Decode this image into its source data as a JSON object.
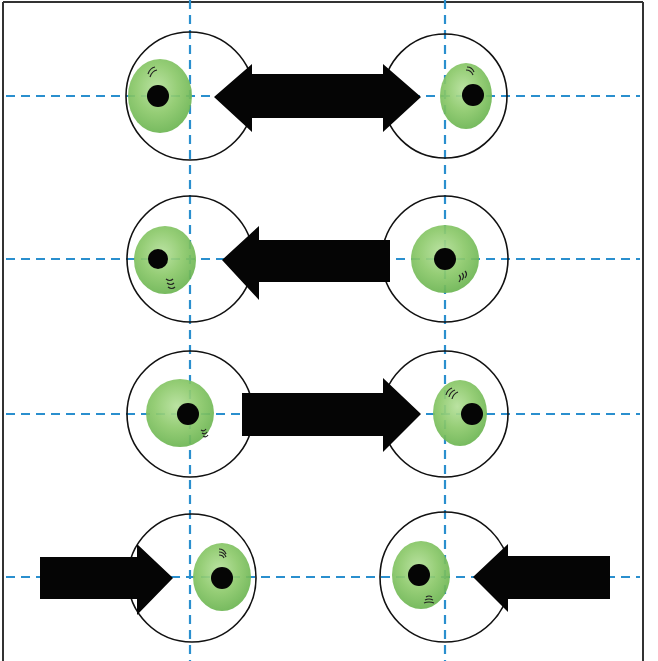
{
  "figure": {
    "colors": {
      "background": "#ffffff",
      "border": "#333333",
      "guide_line": "#2a8fce",
      "circle_outline": "#111111",
      "iris": "#8cc96a",
      "iris_dark": "#5fae47",
      "pupil": "#050505",
      "arrow": "#050505"
    },
    "frame": {
      "left": 3,
      "right": 643,
      "top": 2
    },
    "vertical_guides": [
      190,
      445
    ],
    "rows": [
      {
        "id": "row-1",
        "guide_y": 96,
        "arrow": "double-headed",
        "left_eye": {
          "circle_cx": 190,
          "iris_cx": 160,
          "pupil_cx": 158,
          "gaze": "left"
        },
        "right_eye": {
          "circle_cx": 445,
          "iris_cx": 466,
          "pupil_cx": 473,
          "gaze": "right"
        }
      },
      {
        "id": "row-2",
        "guide_y": 259,
        "arrow": "pointing-left",
        "left_eye": {
          "circle_cx": 190,
          "iris_cx": 165,
          "pupil_cx": 158,
          "gaze": "left"
        },
        "right_eye": {
          "circle_cx": 445,
          "iris_cx": 445,
          "pupil_cx": 445,
          "gaze": "center"
        }
      },
      {
        "id": "row-3",
        "guide_y": 414,
        "arrow": "pointing-right",
        "left_eye": {
          "circle_cx": 190,
          "iris_cx": 180,
          "pupil_cx": 188,
          "gaze": "center"
        },
        "right_eye": {
          "circle_cx": 445,
          "iris_cx": 460,
          "pupil_cx": 472,
          "gaze": "right"
        }
      },
      {
        "id": "row-4",
        "guide_y": 577,
        "arrow": "converging",
        "left_eye": {
          "circle_cx": 192,
          "iris_cx": 222,
          "pupil_cx": 222,
          "gaze": "right"
        },
        "right_eye": {
          "circle_cx": 445,
          "iris_cx": 421,
          "pupil_cx": 419,
          "gaze": "left"
        }
      }
    ]
  }
}
